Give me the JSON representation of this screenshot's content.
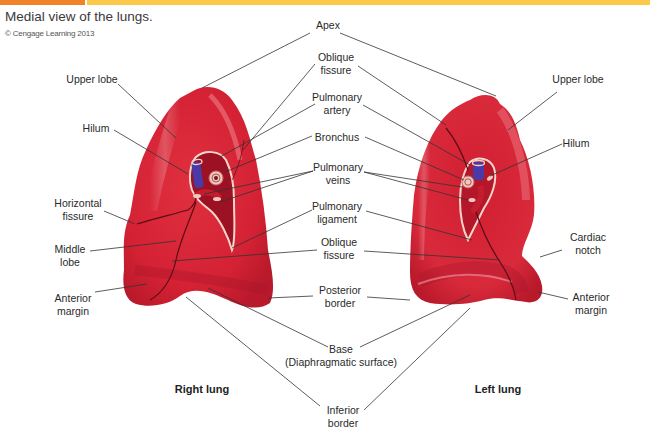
{
  "header": {
    "caption": "Medial view of the lungs.",
    "credit": "© Cengage Learning 2013",
    "colors": {
      "tag": "#f0822a",
      "band": "#fdc94a"
    }
  },
  "lungs": {
    "right": {
      "title": "Right lung"
    },
    "left": {
      "title": "Left lung"
    },
    "colors": {
      "tissue": "#d92436",
      "highlight": "#f27a86",
      "shadow": "#b3172a",
      "vein_blue": "#4a3aa8",
      "vessel": "#c41e2e"
    }
  },
  "labels": {
    "center": {
      "apex": "Apex",
      "oblique_fissure_top": [
        "Oblique",
        "fissure"
      ],
      "pulmonary_artery": [
        "Pulmonary",
        "artery"
      ],
      "bronchus": "Bronchus",
      "pulmonary_veins": [
        "Pulmonary",
        "veins"
      ],
      "pulmonary_ligament": [
        "Pulmonary",
        "ligament"
      ],
      "oblique_fissure_bottom": [
        "Oblique",
        "fissure"
      ],
      "posterior_border": [
        "Posterior",
        "border"
      ],
      "base": [
        "Base",
        "(Diaphragmatic surface)"
      ],
      "inferior_border": [
        "Inferior",
        "border"
      ]
    },
    "right_lung": {
      "upper_lobe": "Upper lobe",
      "hilum": "Hilum",
      "horizontal_fissure": [
        "Horizontal",
        "fissure"
      ],
      "middle_lobe": [
        "Middle",
        "lobe"
      ],
      "anterior_margin": [
        "Anterior",
        "margin"
      ]
    },
    "left_lung": {
      "upper_lobe": "Upper lobe",
      "hilum": "Hilum",
      "cardiac_notch": [
        "Cardiac",
        "notch"
      ],
      "anterior_margin": [
        "Anterior",
        "margin"
      ]
    }
  }
}
